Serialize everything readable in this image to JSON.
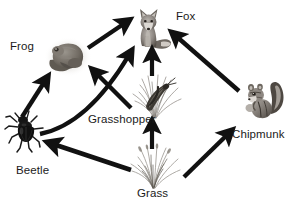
{
  "diagram": {
    "type": "food-web",
    "background_color": "#ffffff",
    "arrow_color": "#111111",
    "label_color": "#1b1b1b",
    "nodes": [
      {
        "id": "fox",
        "label": "Fox",
        "icon": "fox-illustration",
        "label_x": 176,
        "label_y": 11,
        "img_x": 128,
        "img_y": 6,
        "img_w": 46,
        "img_h": 46
      },
      {
        "id": "frog",
        "label": "Frog",
        "icon": "frog-illustration",
        "label_x": 10,
        "label_y": 40,
        "img_x": 44,
        "img_y": 36,
        "img_w": 48,
        "img_h": 42
      },
      {
        "id": "beetle",
        "label": "Beetle",
        "icon": "beetle-illustration",
        "label_x": 16,
        "label_y": 164,
        "img_x": 4,
        "img_y": 110,
        "img_w": 46,
        "img_h": 44
      },
      {
        "id": "grasshopper",
        "label": "Grasshopper",
        "icon": "grasshopper-illustration",
        "label_x": 88,
        "label_y": 114,
        "img_x": 128,
        "img_y": 72,
        "img_w": 56,
        "img_h": 50
      },
      {
        "id": "grass",
        "label": "Grass",
        "icon": "grass-illustration",
        "label_x": 136,
        "label_y": 187,
        "img_x": 126,
        "img_y": 144,
        "img_w": 56,
        "img_h": 46
      },
      {
        "id": "chipmunk",
        "label": "Chipmunk",
        "icon": "chipmunk-illustration",
        "label_x": 232,
        "label_y": 128,
        "img_x": 238,
        "img_y": 78,
        "img_w": 48,
        "img_h": 46
      }
    ],
    "edges": [
      {
        "id": "frog-to-fox",
        "from": "frog",
        "to": "fox",
        "shape": "straight",
        "x1": 88,
        "y1": 48,
        "x2": 127,
        "y2": 21
      },
      {
        "id": "beetle-to-frog",
        "from": "beetle",
        "to": "frog",
        "shape": "straight",
        "x1": 22,
        "y1": 116,
        "x2": 47,
        "y2": 78
      },
      {
        "id": "beetle-to-fox",
        "from": "beetle",
        "to": "fox",
        "shape": "curved",
        "x1": 40,
        "y1": 133,
        "x2": 132,
        "y2": 51
      },
      {
        "id": "grasshopper-to-frog",
        "from": "grasshopper",
        "to": "frog",
        "shape": "straight",
        "x1": 130,
        "y1": 107,
        "x2": 93,
        "y2": 70
      },
      {
        "id": "grasshopper-to-fox",
        "from": "grasshopper",
        "to": "fox",
        "shape": "straight",
        "x1": 152,
        "y1": 76,
        "x2": 152,
        "y2": 52
      },
      {
        "id": "grass-to-grasshopper",
        "from": "grass",
        "to": "grasshopper",
        "shape": "straight",
        "x1": 152,
        "y1": 149,
        "x2": 152,
        "y2": 123
      },
      {
        "id": "grass-to-beetle",
        "from": "grass",
        "to": "beetle",
        "shape": "straight",
        "x1": 131,
        "y1": 169,
        "x2": 50,
        "y2": 143
      },
      {
        "id": "grass-to-chipmunk",
        "from": "grass",
        "to": "chipmunk",
        "shape": "straight",
        "x1": 184,
        "y1": 176,
        "x2": 231,
        "y2": 131
      },
      {
        "id": "chipmunk-to-fox",
        "from": "chipmunk",
        "to": "fox",
        "shape": "straight",
        "x1": 238,
        "y1": 90,
        "x2": 173,
        "y2": 33
      }
    ]
  }
}
